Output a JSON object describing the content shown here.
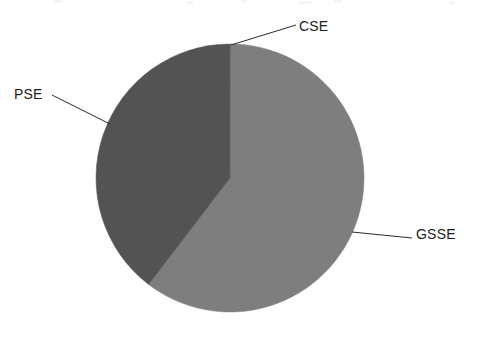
{
  "page": {
    "background_color": "#ffffff",
    "width": 481,
    "height": 339
  },
  "chart_data": {
    "type": "pie",
    "title": "",
    "subtitle": "",
    "xlabel": "",
    "ylabel": "",
    "grid": false,
    "legend_position": "callout-labels",
    "start_angle_deg": 0,
    "direction": "clockwise",
    "center": {
      "x": 230,
      "y": 178
    },
    "radius": 134,
    "categories": [
      "GSSE",
      "PSE",
      "CSE"
    ],
    "values": [
      60.0,
      39.7,
      0.3
    ],
    "value_unit": "percent",
    "slices": [
      {
        "label": "GSSE",
        "value": 60.0,
        "color": "#7e7e7e",
        "start_angle_deg": 0.3,
        "end_angle_deg": 217.4,
        "label_position": "right"
      },
      {
        "label": "PSE",
        "value": 39.7,
        "color": "#535353",
        "start_angle_deg": 217.4,
        "end_angle_deg": 360.0,
        "label_position": "left"
      },
      {
        "label": "CSE",
        "value": 0.3,
        "color": "#6a6a6a",
        "start_angle_deg": 0.0,
        "end_angle_deg": 0.3,
        "label_position": "top-right"
      }
    ],
    "annotations": [
      {
        "text": "CSE",
        "leader_from": {
          "x": 231,
          "y": 45
        },
        "leader_to": {
          "x": 296,
          "y": 25
        }
      },
      {
        "text": "PSE",
        "leader_from": {
          "x": 110,
          "y": 124
        },
        "leader_to": {
          "x": 52,
          "y": 95
        }
      },
      {
        "text": "GSSE",
        "leader_from": {
          "x": 352,
          "y": 232
        },
        "leader_to": {
          "x": 412,
          "y": 238
        }
      }
    ]
  },
  "labels": {
    "cse": "CSE",
    "pse": "PSE",
    "gsse": "GSSE"
  },
  "style": {
    "slice_dark": "#535353",
    "slice_light": "#7e7e7e",
    "slice_cse": "#6a6a6a",
    "leader_line_color": "#2a2a2a",
    "text_color": "#1c1c1c"
  }
}
